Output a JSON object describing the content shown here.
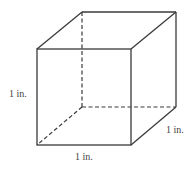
{
  "figure": {
    "type": "cube",
    "colors": {
      "edge": "#3a3a3a",
      "label": "#444444",
      "background": "#ffffff"
    },
    "vertices": {
      "front_top_left": [
        37,
        49
      ],
      "front_top_right": [
        131,
        49
      ],
      "front_bottom_right": [
        131,
        145
      ],
      "front_bottom_left": [
        37,
        145
      ],
      "back_top_left": [
        82,
        12
      ],
      "back_top_right": [
        176,
        12
      ],
      "back_bottom_right": [
        176,
        107
      ],
      "back_bottom_left": [
        82,
        107
      ]
    },
    "labels": {
      "height": "1 in.",
      "width": "1 in.",
      "depth": "1 in."
    }
  }
}
